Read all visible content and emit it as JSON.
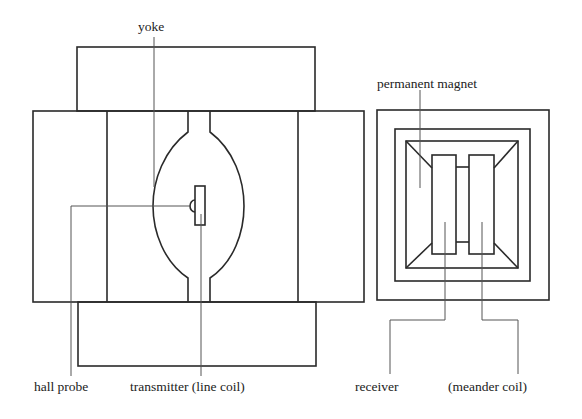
{
  "diagram": {
    "title": "",
    "labels": {
      "yoke": "yoke",
      "permanent_magnet": "permanent magnet",
      "hall_probe": "hall probe",
      "transmitter": "transmitter (line coil)",
      "receiver": "receiver",
      "meander_coil": "(meander coil)"
    },
    "views": [
      {
        "name": "side-view",
        "components": [
          "yoke",
          "pole pieces",
          "air gap",
          "transmitter (line coil)",
          "hall probe"
        ]
      },
      {
        "name": "top-view",
        "components": [
          "permanent magnet",
          "receiver",
          "meander coil"
        ]
      }
    ],
    "colors": {
      "line": "#2a2a2a",
      "leader": "#555555",
      "text": "#222222",
      "background": "#ffffff"
    }
  }
}
